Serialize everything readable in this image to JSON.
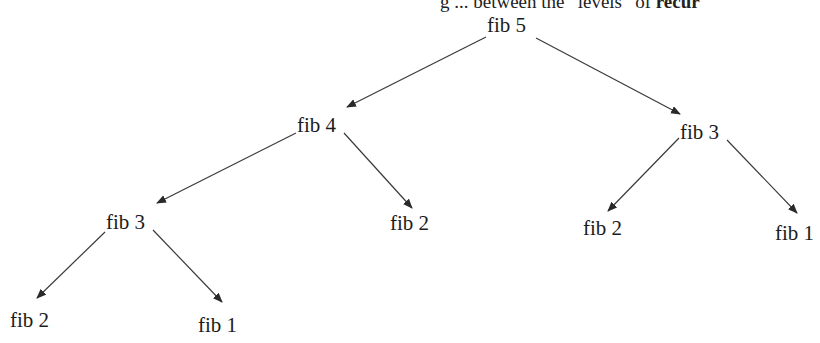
{
  "caption": {
    "text_prefix": "g ... between the “levels” of",
    "text_bold": "recur"
  },
  "diagram": {
    "type": "tree",
    "nodes": [
      {
        "id": "n1",
        "label": "fib 5",
        "x": 487,
        "y": 14
      },
      {
        "id": "n2",
        "label": "fib 4",
        "x": 297,
        "y": 114
      },
      {
        "id": "n3",
        "label": "fib 3",
        "x": 680,
        "y": 121
      },
      {
        "id": "n4",
        "label": "fib 3",
        "x": 106,
        "y": 211
      },
      {
        "id": "n5",
        "label": "fib 2",
        "x": 390,
        "y": 212
      },
      {
        "id": "n6",
        "label": "fib 2",
        "x": 583,
        "y": 217
      },
      {
        "id": "n7",
        "label": "fib 1",
        "x": 775,
        "y": 222
      },
      {
        "id": "n8",
        "label": "fib 2",
        "x": 10,
        "y": 309
      },
      {
        "id": "n9",
        "label": "fib 1",
        "x": 198,
        "y": 314
      }
    ],
    "edges": [
      {
        "from": "n1",
        "to": "n2",
        "x1": 486,
        "y1": 37,
        "x2": 347,
        "y2": 107
      },
      {
        "from": "n1",
        "to": "n3",
        "x1": 536,
        "y1": 38,
        "x2": 680,
        "y2": 114
      },
      {
        "from": "n2",
        "to": "n4",
        "x1": 296,
        "y1": 133,
        "x2": 157,
        "y2": 203
      },
      {
        "from": "n2",
        "to": "n5",
        "x1": 344,
        "y1": 133,
        "x2": 412,
        "y2": 208
      },
      {
        "from": "n3",
        "to": "n6",
        "x1": 679,
        "y1": 138,
        "x2": 608,
        "y2": 211
      },
      {
        "from": "n3",
        "to": "n7",
        "x1": 727,
        "y1": 140,
        "x2": 797,
        "y2": 213
      },
      {
        "from": "n4",
        "to": "n8",
        "x1": 105,
        "y1": 232,
        "x2": 37,
        "y2": 298
      },
      {
        "from": "n4",
        "to": "n9",
        "x1": 153,
        "y1": 230,
        "x2": 222,
        "y2": 302
      }
    ],
    "colors": {
      "edge": "#3a3a3a",
      "text": "#1c1c1c"
    }
  }
}
